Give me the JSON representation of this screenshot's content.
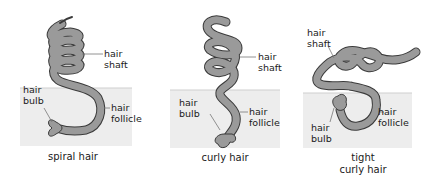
{
  "colors": {
    "hair_fill": "#9a9a9a",
    "hair_outline": "#3a3a3a",
    "skin": "#ededed",
    "skin_line": "#cfcfcf",
    "leader_line": "#777777",
    "text": "#1a1a1a"
  },
  "panels": [
    {
      "caption": "spiral hair",
      "labels": {
        "shaft": "hair\nshaft",
        "bulb": "hair\nbulb",
        "follicle": "hair\nfollicle"
      }
    },
    {
      "caption": "curly hair",
      "labels": {
        "shaft": "hair\nshaft",
        "bulb": "hair\nbulb",
        "follicle": "hair\nfollicle"
      }
    },
    {
      "caption": "tight\ncurly hair",
      "labels": {
        "shaft": "hair\nshaft",
        "bulb": "hair\nbulb",
        "follicle": "hair\nfollicle"
      }
    }
  ]
}
